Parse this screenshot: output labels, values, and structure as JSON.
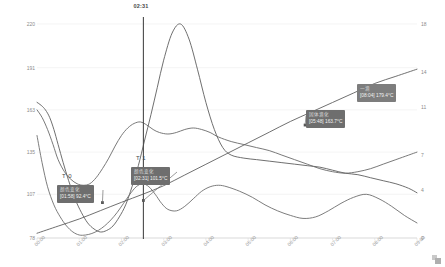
{
  "chart_data": {
    "type": "line",
    "title": "",
    "xlabel": "",
    "ylabel": "",
    "grid": true,
    "legend_position": "none",
    "x_tick_labels": [
      "00:00",
      "01:00",
      "02:00",
      "03:00",
      "04:00",
      "05:00",
      "06:00",
      "07:00",
      "08:00",
      "09:00"
    ],
    "x_range": [
      "00:00",
      "09:00"
    ],
    "left_axis": {
      "ticks": [
        78,
        107,
        135,
        163,
        191,
        220
      ],
      "ylim": [
        78,
        220
      ],
      "label": ""
    },
    "right_axis": {
      "ticks": [
        0,
        4,
        7,
        11,
        14,
        18
      ],
      "ylim": [
        0,
        18
      ],
      "label": ""
    },
    "cursor": {
      "label": "02:31",
      "x_value": 2.52
    },
    "series": [
      {
        "name": "series-1",
        "axis": "left",
        "color": "#5f5f5f",
        "x": [
          0.0,
          0.1,
          0.2,
          0.3,
          0.4,
          0.5,
          0.62,
          0.75,
          0.9,
          1.05,
          1.2,
          1.35,
          1.5,
          1.65,
          1.8,
          1.95,
          2.1,
          2.25,
          2.4,
          2.55,
          2.7,
          2.85,
          3.0,
          3.2,
          3.4,
          3.6,
          3.8,
          4.0,
          4.2,
          4.4,
          4.6,
          4.9,
          5.2,
          5.5,
          5.8,
          6.1,
          6.4,
          6.7,
          7.0,
          7.3,
          7.6,
          7.9,
          8.2,
          8.5,
          8.8,
          9.0
        ],
        "values": [
          168,
          166,
          163,
          158,
          150,
          140,
          128,
          116,
          104,
          95,
          88,
          84,
          82,
          83,
          86,
          92,
          100,
          112,
          126,
          143,
          160,
          178,
          196,
          214,
          220,
          210,
          190,
          168,
          150,
          138,
          133,
          131,
          130,
          129,
          128,
          127,
          126,
          125,
          123,
          121,
          120,
          118,
          116,
          114,
          111,
          108
        ]
      },
      {
        "name": "series-2",
        "axis": "left",
        "color": "#6a6a6a",
        "x": [
          0.0,
          0.12,
          0.25,
          0.38,
          0.5,
          0.65,
          0.8,
          0.95,
          1.1,
          1.25,
          1.4,
          1.55,
          1.7,
          1.85,
          2.0,
          2.15,
          2.3,
          2.45,
          2.6,
          2.75,
          2.9,
          3.1,
          3.3,
          3.5,
          3.7,
          3.9,
          4.1,
          4.3,
          4.6,
          4.9,
          5.2,
          5.5,
          5.8,
          6.1,
          6.4,
          6.7,
          7.0,
          7.3,
          7.6,
          7.9,
          8.2,
          8.5,
          8.8,
          9.0
        ],
        "values": [
          163,
          158,
          150,
          140,
          130,
          122,
          117,
          114,
          113,
          114,
          118,
          124,
          131,
          139,
          146,
          151,
          154,
          155,
          153,
          150,
          148,
          147,
          148,
          150,
          151,
          150,
          148,
          145,
          142,
          140,
          138,
          136,
          133,
          130,
          127,
          124,
          122,
          121,
          122,
          124,
          127,
          130,
          133,
          135
        ]
      },
      {
        "name": "series-3",
        "axis": "left",
        "color": "#6e6e6e",
        "x": [
          0.0,
          0.12,
          0.25,
          0.4,
          0.55,
          0.7,
          0.85,
          1.0,
          1.15,
          1.3,
          1.45,
          1.6,
          1.75,
          1.9,
          2.05,
          2.2,
          2.35,
          2.5,
          2.65,
          2.8,
          2.95,
          3.1,
          3.3,
          3.5,
          3.7,
          3.9,
          4.1,
          4.3,
          4.5,
          4.8,
          5.1,
          5.4,
          5.7,
          6.0,
          6.3,
          6.6,
          6.9,
          7.2,
          7.5,
          7.8,
          8.1,
          8.4,
          8.7,
          9.0
        ],
        "values": [
          146,
          128,
          112,
          100,
          92,
          86,
          82,
          80,
          80,
          81,
          83,
          86,
          90,
          95,
          101,
          107,
          112,
          114,
          112,
          107,
          101,
          97,
          96,
          99,
          104,
          109,
          112,
          113,
          112,
          109,
          105,
          100,
          96,
          93,
          91,
          92,
          96,
          101,
          105,
          107,
          104,
          99,
          93,
          88
        ]
      },
      {
        "name": "series-4",
        "axis": "right",
        "color": "#606060",
        "x": [
          0.0,
          0.5,
          1.0,
          1.5,
          2.0,
          2.52,
          3.0,
          3.5,
          4.0,
          4.5,
          5.0,
          5.5,
          6.0,
          6.5,
          7.0,
          7.5,
          8.0,
          8.5,
          9.0
        ],
        "values": [
          0.4,
          1.0,
          1.6,
          2.3,
          3.0,
          3.7,
          4.4,
          5.3,
          6.2,
          7.1,
          8.0,
          8.9,
          9.8,
          10.6,
          11.4,
          12.2,
          13.0,
          13.6,
          14.2
        ]
      }
    ],
    "points": [
      {
        "name": "point-t0",
        "x": 1.55,
        "axis": "left",
        "value": 101.5
      },
      {
        "name": "point-t1",
        "x": 2.52,
        "axis": "left",
        "value": 102.9
      },
      {
        "name": "point-right-1",
        "x": 6.35,
        "axis": "right",
        "value": 9.5
      },
      {
        "name": "point-right-2",
        "x": 7.85,
        "axis": "right",
        "value": 12.3
      }
    ],
    "annotations": [
      {
        "name": "marker-t0",
        "label": "T 0"
      },
      {
        "name": "marker-t1",
        "label": "T 1"
      }
    ],
    "tooltips": [
      {
        "name": "tooltip-t0",
        "line1": "颜色变化",
        "line2": "[01:58] 92.4°C"
      },
      {
        "name": "tooltip-t1",
        "line1": "颜色变化",
        "line2": "[02:31] 101.5°C"
      },
      {
        "name": "tooltip-reaction",
        "line1": "固体滴化",
        "line2": "[05:48] 163.7°C"
      },
      {
        "name": "tooltip-peak",
        "line1": "一滴",
        "line2": "[08:04] 179.4°C"
      }
    ]
  },
  "watermark": {
    "name": "corner-watermark"
  }
}
